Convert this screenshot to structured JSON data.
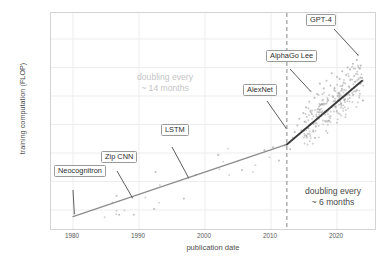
{
  "chart_data": {
    "type": "scatter",
    "title": "",
    "xlabel": "publication date",
    "ylabel": "training computation (FLOP)",
    "xlim": [
      1975,
      2025
    ],
    "ylim_log10": [
      7.8,
      28.6
    ],
    "x_ticks": [
      "1980",
      "1990",
      "2000",
      "2010",
      "2020"
    ],
    "x_tick_values": [
      1980,
      1990,
      2000,
      2010,
      2020
    ],
    "y_ticks": [
      "1e+09",
      "1e+12",
      "1e+15",
      "1e+18",
      "1e+21",
      "1e+24",
      "1e+27"
    ],
    "y_tick_log10": [
      9,
      12,
      15,
      18,
      21,
      24,
      27
    ],
    "grid": true,
    "legend": "none",
    "annotations": [
      {
        "label": "Neocognitron",
        "point_x": 1980.2,
        "point_y_log10": 8.6
      },
      {
        "label": "Zip CNN",
        "point_x": 1989.0,
        "point_y_log10": 10.3
      },
      {
        "label": "LSTM",
        "point_x": 1997.5,
        "point_y_log10": 12.4
      },
      {
        "label": "AlexNet",
        "point_x": 2012.3,
        "point_y_log10": 17.6
      },
      {
        "label": "AlphaGo Lee",
        "point_x": 2016.0,
        "point_y_log10": 21.5
      },
      {
        "label": "GPT-4",
        "point_x": 2023.2,
        "point_y_log10": 25.3
      }
    ],
    "era_notes": [
      {
        "text_line1": "doubling every",
        "text_line2": "~ 14 months",
        "color": "#c4c4c4",
        "era": "pre-deep-learning"
      },
      {
        "text_line1": "doubling every",
        "text_line2": "~ 6 months",
        "color": "#4a4a4a",
        "era": "deep-learning"
      }
    ],
    "breakpoint_year": 2012.4,
    "trend_lines": [
      {
        "name": "pre-2012 trend",
        "color": "#8c8c8c",
        "x_start": 1980.0,
        "y_start_log10": 8.3,
        "x_end": 2012.4,
        "y_end_log10": 15.9
      },
      {
        "name": "post-2012 trend",
        "color": "#3a3a3a",
        "x_start": 2012.4,
        "y_start_log10": 15.9,
        "x_end": 2023.8,
        "y_end_log10": 22.6
      }
    ],
    "series": [
      {
        "name": "AI systems",
        "color": "#9b9b9b",
        "points": [
          [
            1980.2,
            8.6
          ],
          [
            1986.6,
            10.5
          ],
          [
            1987.0,
            8.5
          ],
          [
            1989.2,
            8.5
          ],
          [
            1989.0,
            10.3
          ],
          [
            1992.3,
            9.1
          ],
          [
            1992.5,
            13.0
          ],
          [
            1996.8,
            10.2
          ],
          [
            1997.5,
            12.4
          ],
          [
            1998.6,
            12.7
          ],
          [
            2002.0,
            14.8
          ],
          [
            2005.6,
            13.2
          ],
          [
            2009.0,
            15.3
          ],
          [
            2010.3,
            15.6
          ],
          [
            2011.2,
            14.2
          ],
          [
            2012.1,
            15.8
          ],
          [
            2012.3,
            17.6
          ],
          [
            2012.9,
            15.4
          ],
          [
            2013.3,
            16.6
          ],
          [
            2013.6,
            17.2
          ],
          [
            2014.0,
            17.9
          ],
          [
            2014.3,
            18.6
          ],
          [
            2014.6,
            17.4
          ],
          [
            2014.9,
            19.2
          ],
          [
            2015.1,
            18.3
          ],
          [
            2015.3,
            19.8
          ],
          [
            2015.6,
            17.0
          ],
          [
            2015.8,
            20.4
          ],
          [
            2016.0,
            21.5
          ],
          [
            2016.2,
            19.1
          ],
          [
            2016.4,
            18.2
          ],
          [
            2016.6,
            20.8
          ],
          [
            2016.8,
            17.8
          ],
          [
            2017.0,
            21.2
          ],
          [
            2017.2,
            19.6
          ],
          [
            2017.4,
            22.3
          ],
          [
            2017.6,
            18.9
          ],
          [
            2017.8,
            20.1
          ],
          [
            2018.0,
            21.8
          ],
          [
            2018.2,
            19.4
          ],
          [
            2018.4,
            22.6
          ],
          [
            2018.6,
            20.6
          ],
          [
            2018.8,
            18.4
          ],
          [
            2019.0,
            22.1
          ],
          [
            2019.2,
            23.4
          ],
          [
            2019.4,
            20.9
          ],
          [
            2019.6,
            21.6
          ],
          [
            2019.8,
            19.8
          ],
          [
            2020.0,
            23.0
          ],
          [
            2020.2,
            21.3
          ],
          [
            2020.4,
            22.8
          ],
          [
            2020.6,
            20.2
          ],
          [
            2020.8,
            23.6
          ],
          [
            2021.0,
            22.4
          ],
          [
            2021.2,
            21.0
          ],
          [
            2021.4,
            23.2
          ],
          [
            2021.6,
            24.0
          ],
          [
            2021.8,
            22.0
          ],
          [
            2022.0,
            23.8
          ],
          [
            2022.2,
            21.7
          ],
          [
            2022.4,
            24.4
          ],
          [
            2022.6,
            23.1
          ],
          [
            2022.8,
            22.5
          ],
          [
            2023.0,
            24.8
          ],
          [
            2023.2,
            25.3
          ],
          [
            2023.4,
            23.9
          ],
          [
            2023.6,
            24.2
          ],
          [
            2023.8,
            22.9
          ]
        ]
      }
    ]
  },
  "axes": {
    "y_title": "training computation (FLOP)",
    "x_title": "publication date",
    "y_tick_labels": [
      "1e+27",
      "1e+24",
      "1e+21",
      "1e+18",
      "1e+15",
      "1e+12",
      "1e+09"
    ],
    "x_tick_labels": [
      "1980",
      "1990",
      "2000",
      "2010",
      "2020"
    ]
  },
  "labels": {
    "gpt4": "GPT‑4",
    "alphago": "AlphaGo Lee",
    "alexnet": "AlexNet",
    "lstm": "LSTM",
    "zipcnn": "Zip CNN",
    "neocognitron": "Neocognitron"
  },
  "notes": {
    "pre_line1": "doubling every",
    "pre_line2": "~ 14 months",
    "post_line1": "doubling every",
    "post_line2": "~ 6 months"
  },
  "colors": {
    "point": "#9b9b9b",
    "trend_early": "#8c8c8c",
    "trend_late": "#3a3a3a",
    "breakpoint": "#9a9a9a",
    "grid": "#ededed",
    "panel_border": "#d4d4d4",
    "note_light": "#c4c4c4",
    "note_dark": "#4a4a4a"
  }
}
